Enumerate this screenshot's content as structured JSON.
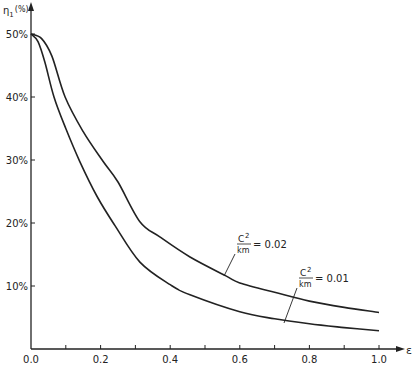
{
  "chart_data": {
    "type": "line",
    "title": "",
    "xlabel": "ε",
    "ylabel": "η1 (%)",
    "ylabel_main": "η",
    "ylabel_sub": "1",
    "ylabel_unit": "(%)",
    "xlim": [
      0,
      1.0
    ],
    "ylim": [
      0,
      50
    ],
    "grid": false,
    "legend": "inline annotations",
    "x_ticks": [
      0.0,
      0.1,
      0.2,
      0.3,
      0.4,
      0.5,
      0.6,
      0.7,
      0.8,
      0.9,
      1.0
    ],
    "x_tick_labels": [
      "0.0",
      "",
      "0.2",
      "",
      "0.4",
      "",
      "0.6",
      "",
      "0.8",
      "",
      "1.0"
    ],
    "y_ticks": [
      10,
      20,
      30,
      40,
      50
    ],
    "y_tick_labels": [
      "10%",
      "20%",
      "30%",
      "40%",
      "50%"
    ],
    "series": [
      {
        "name": "C²/km = 0.02",
        "label_num": "C",
        "label_sup": "2",
        "label_den": "km",
        "label_value": "= 0.02",
        "x": [
          0.0,
          0.03,
          0.06,
          0.098,
          0.15,
          0.207,
          0.25,
          0.313,
          0.37,
          0.457,
          0.56,
          0.6,
          0.7,
          0.8,
          0.9,
          1.0
        ],
        "y": [
          50,
          49.3,
          46.5,
          40,
          34.5,
          29.8,
          26.5,
          20.2,
          17.8,
          14.6,
          11.6,
          10.5,
          9.0,
          7.6,
          6.6,
          5.8
        ]
      },
      {
        "name": "C²/km = 0.01",
        "label_num": "C",
        "label_sup": "2",
        "label_den": "km",
        "label_value": "= 0.01",
        "x": [
          0.0,
          0.02,
          0.04,
          0.066,
          0.1,
          0.14,
          0.19,
          0.24,
          0.313,
          0.4,
          0.457,
          0.6,
          0.7,
          0.8,
          0.9,
          1.0
        ],
        "y": [
          50,
          48.8,
          45.5,
          40,
          35,
          29.8,
          24.2,
          19.7,
          13.8,
          10.2,
          8.6,
          5.9,
          4.8,
          4.0,
          3.4,
          2.9
        ]
      }
    ],
    "annotations": [
      {
        "series": 0,
        "label_x": 238,
        "label_y": 242,
        "leader_from": [
          235,
          254
        ],
        "leader_to": [
          224,
          276
        ]
      },
      {
        "series": 1,
        "label_x": 300,
        "label_y": 276,
        "leader_from": [
          297,
          288
        ],
        "leader_to": [
          284,
          323
        ]
      }
    ]
  },
  "plot_area": {
    "x0": 31,
    "y0": 349,
    "x1": 379,
    "y_top_value_px": 34
  },
  "colors": {
    "ink": "#222222",
    "background": "#ffffff"
  }
}
